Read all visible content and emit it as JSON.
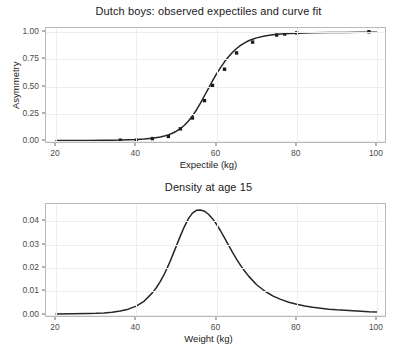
{
  "figure": {
    "width": 417,
    "height": 353,
    "background": "#ffffff",
    "curve_color": "#262626",
    "point_color": "#1a1a1a",
    "grid_color": "#ededed",
    "panel_border_color": "#b9b9b9",
    "axis_text_color": "#4d4d4d"
  },
  "chart_data": [
    {
      "type": "line",
      "id": "expectile-curve-fit",
      "title": "Dutch boys: observed expectiles and curve fit",
      "xlabel": "Expectile (kg)",
      "ylabel": "Asymmetry",
      "xlim": [
        17.5,
        102.5
      ],
      "ylim": [
        -0.03,
        1.04
      ],
      "xticks": [
        20,
        40,
        60,
        80,
        100
      ],
      "xticklabels": [
        "20",
        "40",
        "60",
        "80",
        "100"
      ],
      "yticks": [
        0.0,
        0.25,
        0.5,
        0.75,
        1.0
      ],
      "yticklabels": [
        "0.00",
        "0.25",
        "0.50",
        "0.75",
        "1.00"
      ],
      "grid": true,
      "legend": null,
      "series": [
        {
          "name": "observed expectiles",
          "marker": "square",
          "style": "points",
          "x": [
            36,
            40,
            44,
            48,
            51,
            54,
            57,
            59,
            62,
            65,
            69,
            75,
            77,
            80,
            98
          ],
          "y": [
            0.005,
            0.005,
            0.02,
            0.04,
            0.11,
            0.21,
            0.37,
            0.51,
            0.66,
            0.81,
            0.91,
            0.975,
            0.985,
            0.995,
            1.005
          ]
        },
        {
          "name": "curve fit",
          "style": "line",
          "x": [
            20,
            24,
            28,
            32,
            34,
            36,
            38,
            40,
            42,
            44,
            46,
            47,
            48,
            49,
            50,
            51,
            52,
            53,
            54,
            55,
            56,
            57,
            58,
            59,
            60,
            61,
            62,
            63,
            64,
            65,
            66,
            67,
            68,
            69,
            70,
            72,
            74,
            76,
            78,
            80,
            84,
            88,
            92,
            96,
            100
          ],
          "y": [
            0.002,
            0.002,
            0.003,
            0.004,
            0.005,
            0.006,
            0.009,
            0.012,
            0.017,
            0.024,
            0.035,
            0.043,
            0.054,
            0.069,
            0.088,
            0.112,
            0.143,
            0.182,
            0.229,
            0.284,
            0.347,
            0.415,
            0.484,
            0.552,
            0.616,
            0.675,
            0.728,
            0.775,
            0.816,
            0.851,
            0.88,
            0.903,
            0.922,
            0.937,
            0.949,
            0.966,
            0.977,
            0.984,
            0.989,
            0.992,
            0.996,
            0.998,
            0.999,
            1.0,
            1.0
          ]
        }
      ]
    },
    {
      "type": "line",
      "id": "density-age-15",
      "title": "Density at age 15",
      "xlabel": "Weight (kg)",
      "ylabel": "",
      "xlim": [
        17.5,
        102.5
      ],
      "ylim": [
        -0.0015,
        0.0475
      ],
      "xticks": [
        20,
        40,
        60,
        80,
        100
      ],
      "xticklabels": [
        "20",
        "40",
        "60",
        "80",
        "100"
      ],
      "yticks": [
        0.0,
        0.01,
        0.02,
        0.03,
        0.04
      ],
      "yticklabels": [
        "0.00",
        "0.01",
        "0.02",
        "0.03",
        "0.04"
      ],
      "grid": true,
      "legend": null,
      "series": [
        {
          "name": "density",
          "style": "line",
          "x": [
            20,
            24,
            28,
            30,
            32,
            34,
            36,
            38,
            40,
            42,
            44,
            45,
            46,
            47,
            48,
            49,
            50,
            51,
            52,
            53,
            54,
            55,
            56,
            57,
            58,
            59,
            60,
            61,
            62,
            63,
            64,
            65,
            66,
            67,
            68,
            70,
            72,
            74,
            76,
            78,
            80,
            82,
            84,
            86,
            88,
            90,
            92,
            94,
            96,
            98,
            100
          ],
          "y": [
            0.0002,
            0.0003,
            0.0004,
            0.0005,
            0.0007,
            0.001,
            0.0015,
            0.0023,
            0.0036,
            0.0058,
            0.0093,
            0.0115,
            0.0142,
            0.0174,
            0.0211,
            0.0252,
            0.0295,
            0.0338,
            0.0378,
            0.0412,
            0.0436,
            0.0448,
            0.0449,
            0.0444,
            0.0431,
            0.0412,
            0.0388,
            0.036,
            0.0329,
            0.0298,
            0.0267,
            0.0238,
            0.0211,
            0.0187,
            0.0165,
            0.0128,
            0.0101,
            0.008,
            0.0065,
            0.0053,
            0.0044,
            0.0037,
            0.0031,
            0.0027,
            0.0023,
            0.002,
            0.0018,
            0.0016,
            0.0014,
            0.0012,
            0.0011
          ]
        }
      ]
    }
  ]
}
